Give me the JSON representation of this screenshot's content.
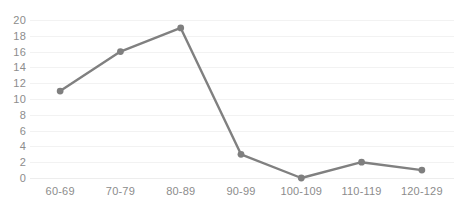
{
  "chart_data": {
    "type": "line",
    "title": "",
    "subtitle": "",
    "xlabel": "",
    "ylabel": "",
    "categories": [
      "60-69",
      "70-79",
      "80-89",
      "90-99",
      "100-109",
      "110-119",
      "120-129"
    ],
    "values": [
      11,
      16,
      19,
      3,
      0,
      2,
      1
    ],
    "series": [
      {
        "name": "",
        "values": [
          11,
          16,
          19,
          3,
          0,
          2,
          1
        ]
      }
    ],
    "ylim": [
      0,
      20
    ],
    "y_ticks": [
      0,
      2,
      4,
      6,
      8,
      10,
      12,
      14,
      16,
      18,
      20
    ],
    "y_tick_labels": [
      "0",
      "2",
      "4",
      "6",
      "8",
      "10",
      "12",
      "14",
      "16",
      "18",
      "20"
    ],
    "grid": true,
    "grid_axis": "y",
    "legend": false,
    "legend_position": "none",
    "marker": "circle",
    "colors": {
      "series": "#808080",
      "marker": "#7f7f7f",
      "gridline": "#f2f2f2",
      "baseline": "#ededed",
      "tick_label": "#8c8c8c",
      "background": "#ffffff"
    }
  }
}
